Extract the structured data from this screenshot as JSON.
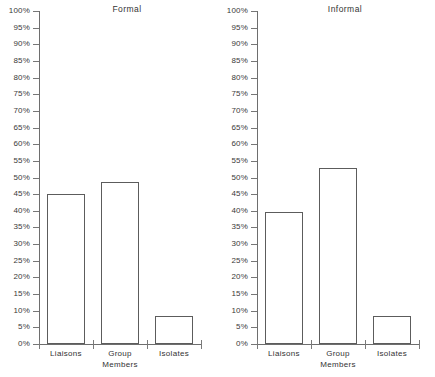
{
  "figure": {
    "background_color": "#ffffff",
    "axis_color": "#6e6e6e",
    "bar_outline_color": "#5c5c5c",
    "bar_fill_color": "#ffffff",
    "text_color": "#333333"
  },
  "panels": [
    {
      "id": "formal",
      "title": "Formal",
      "categories": [
        "Liaisons",
        "Group Members",
        "Isolates"
      ],
      "values": [
        45,
        48.5,
        8.5
      ]
    },
    {
      "id": "informal",
      "title": "Informal",
      "categories": [
        "Liaisons",
        "Group Members",
        "Isolates"
      ],
      "values": [
        39.5,
        53,
        8.5
      ]
    }
  ],
  "axis": {
    "y_ticks": [
      "0%",
      "5%",
      "10%",
      "15%",
      "20%",
      "25%",
      "30%",
      "35%",
      "40%",
      "45%",
      "50%",
      "55%",
      "60%",
      "65%",
      "70%",
      "75%",
      "80%",
      "85%",
      "90%",
      "95%",
      "100%"
    ],
    "y_min": 0,
    "y_max": 100,
    "y_step": 5
  },
  "labels": {
    "cat0": "Liaisons",
    "cat1_line1": "Group",
    "cat1_line2": "Members",
    "cat2": "Isolates"
  },
  "chart_data": {
    "type": "bar",
    "title": "",
    "xlabel": "",
    "ylabel": "",
    "ylim": [
      0,
      100
    ],
    "ytick_step": 5,
    "ytick_format": "percent",
    "grid": false,
    "legend": "none",
    "panels": [
      {
        "title": "Formal",
        "categories": [
          "Liaisons",
          "Group Members",
          "Isolates"
        ],
        "values": [
          45,
          48.5,
          8.5
        ]
      },
      {
        "title": "Informal",
        "categories": [
          "Liaisons",
          "Group Members",
          "Isolates"
        ],
        "values": [
          39.5,
          53,
          8.5
        ]
      }
    ]
  }
}
